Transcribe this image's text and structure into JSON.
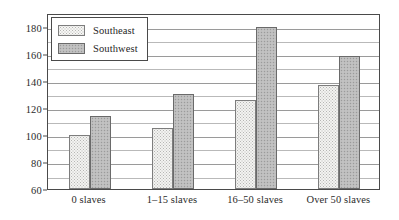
{
  "chart_data": {
    "type": "bar",
    "title": "",
    "subtitle": "",
    "xlabel": "",
    "ylabel": "",
    "categories": [
      "0 slaves",
      "1–15 slaves",
      "16–50 slaves",
      "Over 50 slaves"
    ],
    "series": [
      {
        "name": "Southeast",
        "values": [
          100,
          105,
          126,
          137
        ],
        "color": "#f3f3f1",
        "pattern": "fine-dots"
      },
      {
        "name": "Southwest",
        "values": [
          114,
          130,
          180,
          158
        ],
        "color": "#bcbcbc",
        "pattern": "dense-checker"
      }
    ],
    "ylim": [
      60,
      190
    ],
    "yticks": [
      60,
      80,
      100,
      120,
      140,
      160,
      180
    ],
    "ytick_labels": [
      "60",
      "80",
      "100",
      "120",
      "140",
      "160",
      "180"
    ],
    "gridlines": [
      60,
      70,
      80,
      90,
      100,
      110,
      120,
      130,
      140,
      150,
      160,
      170,
      180,
      190
    ],
    "grid": true,
    "legend_position": "top-left",
    "legend_entries": [
      "Southeast",
      "Southwest"
    ]
  },
  "legend": {
    "items": [
      {
        "label": "Southeast"
      },
      {
        "label": "Southwest"
      }
    ]
  }
}
